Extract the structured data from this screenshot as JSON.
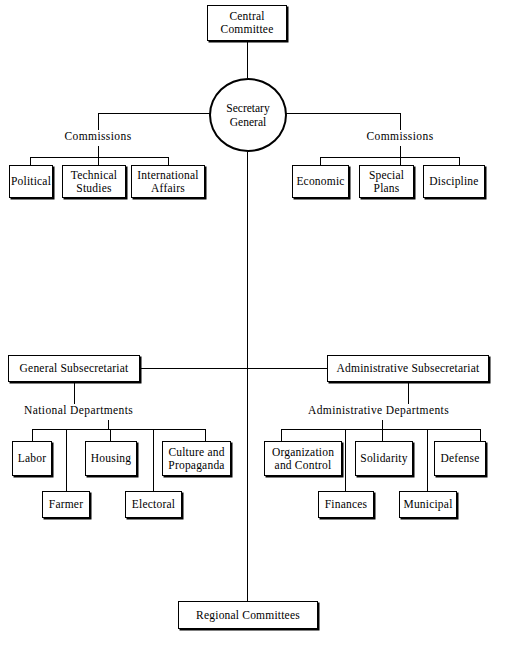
{
  "diagram": {
    "line_color": "#000000",
    "background_color": "#ffffff",
    "nodes": {
      "central_committee": "Central\nCommittee",
      "central_committee_line1": "Central",
      "central_committee_line2": "Committee",
      "secretary_general_line1": "Secretary",
      "secretary_general_line2": "General",
      "commissions_left": "Commissions",
      "commissions_right": "Commissions",
      "political": "Political",
      "technical_studies_line1": "Technical",
      "technical_studies_line2": "Studies",
      "international_affairs_line1": "International",
      "international_affairs_line2": "Affairs",
      "economic": "Economic",
      "special_plans_line1": "Special",
      "special_plans_line2": "Plans",
      "discipline": "Discipline",
      "general_subsecretariat": "General Subsecretariat",
      "administrative_subsecretariat": "Administrative Subsecretariat",
      "national_departments": "National Departments",
      "administrative_departments": "Administrative Departments",
      "labor": "Labor",
      "farmer": "Farmer",
      "housing": "Housing",
      "electoral": "Electoral",
      "culture_and_propaganda_line1": "Culture and",
      "culture_and_propaganda_line2": "Propaganda",
      "organization_and_control_line1": "Organization",
      "organization_and_control_line2": "and Control",
      "finances": "Finances",
      "solidarity": "Solidarity",
      "municipal": "Municipal",
      "defense": "Defense",
      "regional_committees": "Regional Committees"
    }
  }
}
